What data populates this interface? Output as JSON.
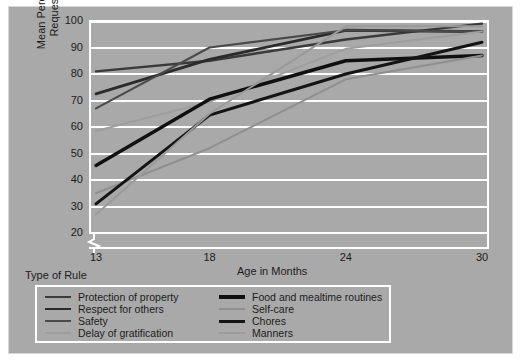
{
  "figure": {
    "background_color": "#a9a9a9",
    "grid_color": "#ffffff",
    "type_of_rule_label": "Type of Rule"
  },
  "axis": {
    "ylabel_line1": "Mean Percentage of Rules",
    "ylabel_line2": "Requested by Mother",
    "xlabel": "Age in Months",
    "yticks": [
      "100",
      "90",
      "80",
      "70",
      "60",
      "50",
      "40",
      "30",
      "20"
    ],
    "xticks": [
      "13",
      "18",
      "24",
      "30"
    ]
  },
  "legend": {
    "left": [
      {
        "label": "Protection of property",
        "color": "#3a3a3a",
        "width": 2.4
      },
      {
        "label": "Respect for others",
        "color": "#2b2b2b",
        "width": 2.8
      },
      {
        "label": "Safety",
        "color": "#4a4a4a",
        "width": 2.0
      },
      {
        "label": "Delay of gratification",
        "color": "#9e9e9e",
        "width": 2.0
      }
    ],
    "right": [
      {
        "label": "Food and mealtime routines",
        "color": "#101010",
        "width": 3.4
      },
      {
        "label": "Self-care",
        "color": "#8f8f8f",
        "width": 2.0
      },
      {
        "label": "Chores",
        "color": "#141414",
        "width": 3.0
      },
      {
        "label": "Manners",
        "color": "#9a9a9a",
        "width": 2.0
      }
    ]
  },
  "chart_data": {
    "type": "line",
    "title": "",
    "xlabel": "Age in Months",
    "ylabel": "Mean Percentage of Rules Requested by Mother",
    "x": [
      13,
      18,
      24,
      30
    ],
    "categories": [
      "13",
      "18",
      "24",
      "30"
    ],
    "xlim": [
      13,
      30
    ],
    "ylim": [
      20,
      100
    ],
    "grid": true,
    "axis_break_y": true,
    "legend_position": "below-left",
    "series": [
      {
        "name": "Protection of property",
        "color": "#3a3a3a",
        "width": 2.4,
        "values": [
          81,
          85,
          93,
          99
        ]
      },
      {
        "name": "Respect for others",
        "color": "#2b2b2b",
        "width": 2.8,
        "values": [
          72.5,
          85.5,
          96.5,
          96
        ]
      },
      {
        "name": "Safety",
        "color": "#4a4a4a",
        "width": 2.0,
        "values": [
          67,
          90,
          96.5,
          96
        ]
      },
      {
        "name": "Delay of gratification",
        "color": "#9e9e9e",
        "width": 2.0,
        "values": [
          58.5,
          69.5,
          89.5,
          96
        ]
      },
      {
        "name": "Food and mealtime routines",
        "color": "#101010",
        "width": 3.4,
        "values": [
          45.5,
          70.5,
          85,
          87
        ]
      },
      {
        "name": "Self-care",
        "color": "#8f8f8f",
        "width": 2.0,
        "values": [
          35,
          52,
          78,
          87
        ]
      },
      {
        "name": "Chores",
        "color": "#141414",
        "width": 3.0,
        "values": [
          31,
          64.5,
          80,
          92
        ]
      },
      {
        "name": "Manners",
        "color": "#9a9a9a",
        "width": 2.0,
        "values": [
          27,
          65,
          98,
          98
        ]
      }
    ]
  }
}
